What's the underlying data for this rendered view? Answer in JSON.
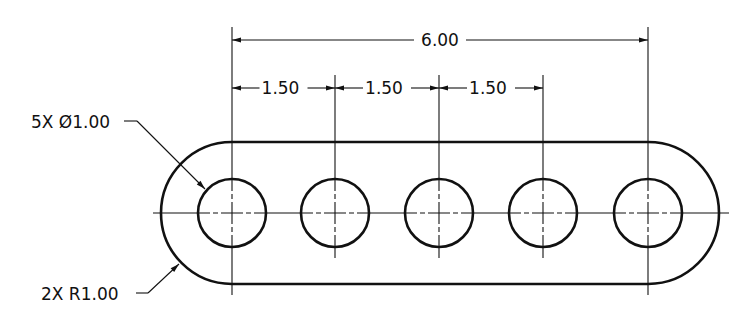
{
  "colors": {
    "line": "#111111",
    "background": "#ffffff"
  },
  "part": {
    "center_y": 213,
    "hole_centers_x": [
      232,
      335,
      439,
      543,
      648
    ],
    "hole_radius": 34,
    "outer_radius": 71
  },
  "dimensions": {
    "overall": {
      "label": "6.00",
      "x1": 232,
      "x2": 648,
      "y": 40,
      "ext_top": 27
    },
    "pitch": [
      {
        "label": "1.50",
        "x1": 232,
        "x2": 335,
        "y": 88
      },
      {
        "label": "1.50",
        "x1": 335,
        "x2": 439,
        "y": 88
      },
      {
        "label": "1.50",
        "x1": 439,
        "x2": 543,
        "y": 88
      }
    ],
    "pitch_ext_top": 75
  },
  "callouts": {
    "holes": {
      "label": "5X Ø1.00",
      "text_x": 31,
      "text_y": 128,
      "shelf_x1": 124,
      "shelf_x2": 137,
      "shelf_y": 121,
      "tip_x": 205,
      "tip_y": 189
    },
    "radius": {
      "label": "2X R1.00",
      "text_x": 41,
      "text_y": 300,
      "shelf_x1": 136,
      "shelf_x2": 148,
      "shelf_y": 293,
      "tip_x": 179,
      "tip_y": 264
    }
  }
}
